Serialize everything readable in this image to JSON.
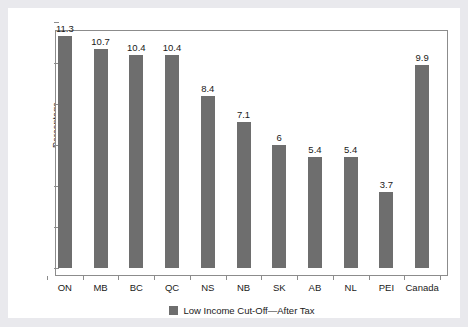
{
  "chart_data": {
    "type": "bar",
    "title": "",
    "subtitle": "",
    "xlabel": "",
    "ylabel": "Percentage",
    "ylim": [
      0,
      12
    ],
    "yticks": [
      0,
      2,
      4,
      6,
      8,
      10,
      12
    ],
    "ytick_labels": [
      "0",
      "2",
      "4",
      "6",
      "8",
      "10",
      "12"
    ],
    "grid": false,
    "legend_position": "bottom-center",
    "legend": [
      "Low Income Cut-Off—After Tax"
    ],
    "categories": [
      "ON",
      "MB",
      "BC",
      "QC",
      "NS",
      "NB",
      "SK",
      "AB",
      "NL",
      "PEI",
      "Canada"
    ],
    "values": [
      11.3,
      10.7,
      10.4,
      10.4,
      8.4,
      7.1,
      6,
      5.4,
      5.4,
      3.7,
      9.9
    ],
    "value_labels": [
      "11.3",
      "10.7",
      "10.4",
      "10.4",
      "8.4",
      "7.1",
      "6",
      "5.4",
      "5.4",
      "3.7",
      "9.9"
    ],
    "series": [
      {
        "name": "Low Income Cut-Off—After Tax",
        "color": "#6e6e6e",
        "values": [
          11.3,
          10.7,
          10.4,
          10.4,
          8.4,
          7.1,
          6,
          5.4,
          5.4,
          3.7,
          9.9
        ]
      }
    ]
  },
  "colors": {
    "bar": "#6e6e6e",
    "axis": "#8c8c8c",
    "text": "#1a1a1a",
    "plot_background": "#ffffff",
    "page_background": "#e9e9ed"
  },
  "legend": {
    "swatch_name": "legend-swatch",
    "label": "Low Income Cut-Off—After Tax"
  },
  "axes": {
    "y_title": "Percentage"
  }
}
